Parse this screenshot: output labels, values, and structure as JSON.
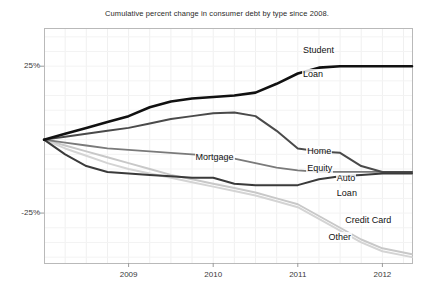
{
  "chart_data": {
    "type": "line",
    "title": "Cumulative percent change in consumer debt by type since 2008.",
    "xlabel": "",
    "ylabel": "",
    "xlim": [
      2008.0,
      2012.35
    ],
    "ylim": [
      -42,
      38
    ],
    "grid": true,
    "legend_position": "inline-labels",
    "yticks": [
      25,
      -25
    ],
    "ytick_labels": [
      "25%",
      "-25%"
    ],
    "xticks": [
      2009,
      2010,
      2011,
      2012
    ],
    "xtick_labels": [
      "2009",
      "2010",
      "2011",
      "2012"
    ],
    "x": [
      2008.0,
      2008.25,
      2008.5,
      2008.75,
      2009.0,
      2009.25,
      2009.5,
      2009.75,
      2010.0,
      2010.25,
      2010.5,
      2010.75,
      2011.0,
      2011.25,
      2011.5,
      2011.75,
      2012.0,
      2012.35
    ],
    "series": [
      {
        "name": "Student Loan",
        "label": "Student Loan",
        "label_line1": "Student",
        "label_line2": "Loan",
        "color": "#111111",
        "width": 2.6,
        "values": [
          0,
          2,
          4,
          6,
          8,
          11,
          13,
          14,
          14.5,
          15,
          16,
          19,
          22.5,
          24.5,
          25,
          25,
          25,
          25
        ]
      },
      {
        "name": "Home Equity",
        "label": "Home Equity",
        "label_line1": "Home",
        "label_line2": "Equity",
        "color": "#4a4a4a",
        "width": 2.0,
        "values": [
          0,
          1,
          2,
          3,
          4,
          5.5,
          7,
          8,
          9,
          9.2,
          8,
          3,
          -3,
          -4,
          -4.5,
          -9,
          -11,
          -11
        ]
      },
      {
        "name": "Mortgage",
        "label": "Mortgage",
        "label_line1": "Mortgage",
        "label_line2": "",
        "color": "#7a7a7a",
        "width": 1.8,
        "values": [
          0,
          -1,
          -2,
          -3,
          -3.5,
          -4,
          -4.5,
          -5,
          -5.5,
          -6.5,
          -8,
          -9.5,
          -10.5,
          -11,
          -11,
          -11,
          -11,
          -11
        ]
      },
      {
        "name": "Auto Loan",
        "label": "Auto Loan",
        "label_line1": "Auto",
        "label_line2": "Loan",
        "color": "#3a3a3a",
        "width": 2.0,
        "values": [
          0,
          -5,
          -9,
          -11,
          -11.5,
          -12,
          -12.5,
          -13,
          -13,
          -15,
          -15.5,
          -15.5,
          -15.5,
          -13.5,
          -12.5,
          -12,
          -11.5,
          -11.5
        ]
      },
      {
        "name": "Credit Card",
        "label": "Credit Card",
        "label_line1": "Credit Card",
        "label_line2": "",
        "color": "#c8c8c8",
        "width": 2.0,
        "values": [
          0,
          -2,
          -4,
          -6,
          -8,
          -10,
          -12,
          -13.5,
          -15,
          -16.5,
          -18,
          -20,
          -22,
          -26,
          -30,
          -34,
          -37,
          -39
        ]
      },
      {
        "name": "Other",
        "label": "Other",
        "label_line1": "Other",
        "label_line2": "",
        "color": "#d4d4d4",
        "width": 2.0,
        "values": [
          0,
          -3,
          -5.5,
          -8,
          -10,
          -11.5,
          -13,
          -14.5,
          -16,
          -17.5,
          -19,
          -21,
          -23,
          -27,
          -31,
          -35,
          -38,
          -40
        ]
      }
    ],
    "annotations": [
      {
        "text": "Student",
        "x": 2011.05,
        "y": 30.5
      },
      {
        "text": "Loan",
        "x": 2011.05,
        "y": 22.5
      },
      {
        "text": "Mortgage",
        "x": 2009.78,
        "y": -6.0
      },
      {
        "text": "Home",
        "x": 2011.1,
        "y": -4.0
      },
      {
        "text": "Equity",
        "x": 2011.1,
        "y": -9.5
      },
      {
        "text": "Auto",
        "x": 2011.45,
        "y": -13.0
      },
      {
        "text": "Loan",
        "x": 2011.45,
        "y": -18.0
      },
      {
        "text": "Credit Card",
        "x": 2011.55,
        "y": -27.5
      },
      {
        "text": "Other",
        "x": 2011.35,
        "y": -33.0
      }
    ]
  }
}
